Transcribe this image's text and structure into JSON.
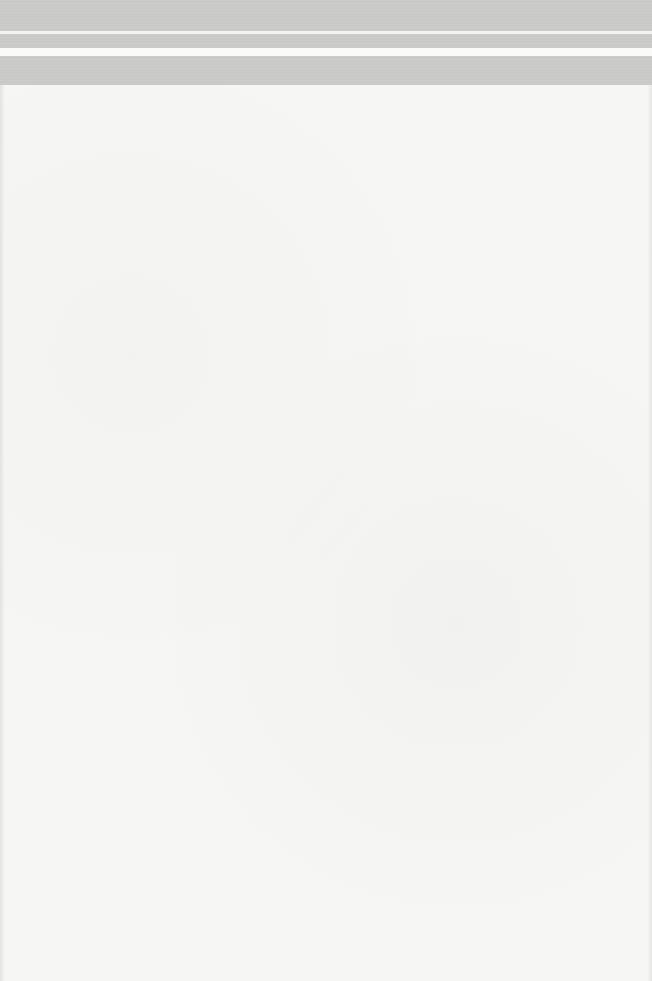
{
  "document": {
    "type": "scanned-page",
    "content": "",
    "colors": {
      "paper": "#f6f6f5",
      "header_band": "#c8c8c7"
    }
  }
}
